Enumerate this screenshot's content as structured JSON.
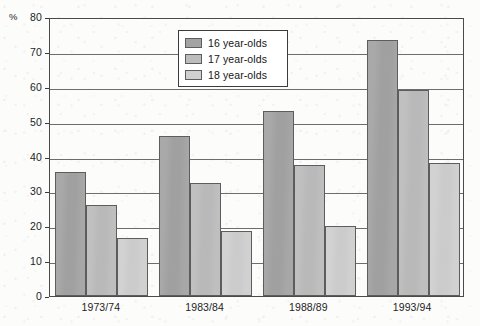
{
  "chart_data": {
    "type": "bar",
    "title": "",
    "subtitle": "",
    "xlabel": "",
    "ylabel": "%",
    "ylim": [
      0,
      80
    ],
    "yticks": [
      0,
      10,
      20,
      30,
      40,
      50,
      60,
      70,
      80
    ],
    "grid": true,
    "legend_position": "upper-center",
    "categories": [
      "1973/74",
      "1983/84",
      "1988/89",
      "1993/94"
    ],
    "series": [
      {
        "name": "16 year-olds",
        "color": "#a3a3a3",
        "values": [
          35.5,
          46,
          53,
          73.5
        ]
      },
      {
        "name": "17 year-olds",
        "color": "#bcbcbc",
        "values": [
          26,
          32.5,
          37.5,
          59
        ]
      },
      {
        "name": "18 year-olds",
        "color": "#cfcfcf",
        "values": [
          16.5,
          18.5,
          20,
          38
        ]
      }
    ]
  },
  "axis": {
    "unit_label": "%",
    "y_tick_labels": [
      "80",
      "70",
      "60",
      "50",
      "40",
      "30",
      "20",
      "10",
      "0"
    ],
    "x_tick_labels": [
      "1973/74",
      "1983/84",
      "1988/89",
      "1993/94"
    ]
  },
  "legend": {
    "entries": [
      {
        "label": "16 year-olds",
        "swatch": "dark-gray-swatch"
      },
      {
        "label": "17 year-olds",
        "swatch": "medium-gray-swatch"
      },
      {
        "label": "18 year-olds",
        "swatch": "light-gray-swatch"
      }
    ]
  }
}
